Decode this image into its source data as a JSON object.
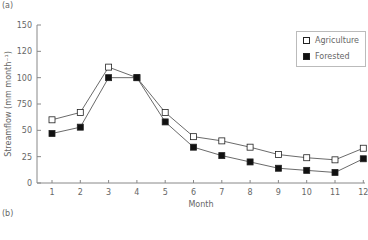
{
  "panel_labels": {
    "top": "(a)",
    "bottom": "(b)"
  },
  "chart_data": {
    "type": "line",
    "title": "",
    "xlabel": "Month",
    "ylabel": "Streamflow (mm month⁻¹)",
    "x": [
      1,
      2,
      3,
      4,
      5,
      6,
      7,
      8,
      9,
      10,
      11,
      12
    ],
    "x_tick_labels": [
      "1",
      "2",
      "3",
      "4",
      "5",
      "6",
      "7",
      "8",
      "9",
      "10",
      "11",
      "12"
    ],
    "y_ticks": [
      0,
      25,
      50,
      75,
      100,
      125,
      150
    ],
    "y_tick_labels": [
      "0",
      "25",
      "50",
      "750",
      "100",
      "120",
      "150"
    ],
    "ylim": [
      0,
      150
    ],
    "grid": false,
    "legend_position": "upper right",
    "series": [
      {
        "name": "Agriculture",
        "marker": "open-square",
        "values": [
          60,
          67,
          110,
          100,
          67,
          44,
          40,
          34,
          27,
          24,
          22,
          33
        ]
      },
      {
        "name": "Forested",
        "marker": "filled-square",
        "values": [
          47,
          53,
          100,
          100,
          58,
          34,
          26,
          20,
          14,
          12,
          10,
          23
        ]
      }
    ]
  },
  "legend": {
    "items": [
      {
        "label": "Agriculture"
      },
      {
        "label": "Forested"
      }
    ]
  }
}
